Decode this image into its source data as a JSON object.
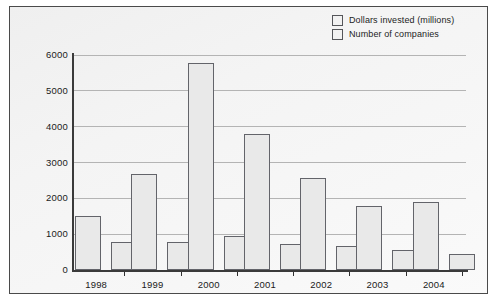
{
  "chart_data": {
    "type": "bar",
    "title": "",
    "xlabel": "",
    "ylabel": "",
    "categories": [
      "1998",
      "1999",
      "2000",
      "2001",
      "2002",
      "2003",
      "2004"
    ],
    "ylim": [
      0,
      6000
    ],
    "yticks": [
      "0",
      "1000",
      "2000",
      "3000",
      "4000",
      "5000",
      "6000"
    ],
    "ytick_values": [
      0,
      1000,
      2000,
      3000,
      4000,
      5000,
      6000
    ],
    "grid": true,
    "legend_position": "top-right",
    "series": [
      {
        "name": "Dollars invested (millions)",
        "values": [
          1520,
          2670,
          5780,
          3790,
          2580,
          1790,
          1890
        ]
      },
      {
        "name": "Number of companies",
        "values": [
          780,
          780,
          960,
          730,
          680,
          570,
          460
        ]
      }
    ]
  },
  "legend": {
    "items": [
      {
        "label": "Dollars invested (millions)",
        "swatch": "#f2f2f2"
      },
      {
        "label": "Number of companies",
        "swatch": "#f2f2f2"
      }
    ]
  },
  "colors": {
    "bar_fill": "#e9e9e9",
    "bar_border": "#63646a",
    "gridline": "#b4b4b4",
    "axis": "#3a3a3a",
    "frame_border": "#4a4a4a",
    "text": "#1a1a1a"
  }
}
